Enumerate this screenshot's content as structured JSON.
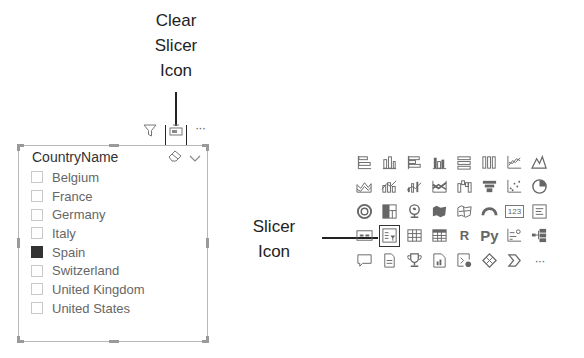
{
  "annotations": {
    "clear_slicer": {
      "lines": [
        "Clear",
        "Slicer",
        "Icon"
      ]
    },
    "slicer_icon": {
      "lines": [
        "Slicer",
        "Icon"
      ]
    }
  },
  "visual_header": {
    "icons": [
      "filter-icon",
      "clear-slicer-icon",
      "more-options-icon"
    ],
    "more_label": "···"
  },
  "slicer": {
    "title": "CountryName",
    "tools": [
      "eraser-icon",
      "chevron-down-icon"
    ],
    "items": [
      {
        "label": "Belgium",
        "checked": false
      },
      {
        "label": "France",
        "checked": false
      },
      {
        "label": "Germany",
        "checked": false
      },
      {
        "label": "Italy",
        "checked": false
      },
      {
        "label": "Spain",
        "checked": true
      },
      {
        "label": "Switzerland",
        "checked": false
      },
      {
        "label": "United Kingdom",
        "checked": false
      },
      {
        "label": "United States",
        "checked": false
      }
    ]
  },
  "visualizations": {
    "rows": [
      [
        "stacked-bar-chart",
        "stacked-column-chart",
        "clustered-bar-chart",
        "clustered-column-chart",
        "100-stacked-bar-chart",
        "100-stacked-column-chart",
        "line-chart",
        "area-chart"
      ],
      [
        "stacked-area-chart",
        "line-and-stacked-column-chart",
        "line-and-clustered-column-chart",
        "ribbon-chart",
        "waterfall-chart",
        "funnel-chart",
        "scatter-chart",
        "pie-chart"
      ],
      [
        "donut-chart",
        "treemap",
        "map",
        "filled-map",
        "shape-map",
        "gauge",
        "card",
        "multi-row-card"
      ],
      [
        "kpi",
        "slicer",
        "table",
        "matrix",
        "r-script-visual",
        "python-visual",
        "key-influencers",
        "decomposition-tree"
      ],
      [
        "q-and-a",
        "paginated-report",
        "smart-narrative",
        "power-apps",
        "power-automate",
        "arcgis-maps",
        "custom-visual",
        "more-visuals"
      ]
    ],
    "text_labels": {
      "r-script-visual": "R",
      "python-visual": "Py",
      "card": "123",
      "more-visuals": "···"
    },
    "selected": "slicer"
  }
}
